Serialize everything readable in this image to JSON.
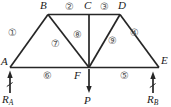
{
  "figure": {
    "nodes": {
      "A": "A",
      "B": "B",
      "C": "C",
      "D": "D",
      "E": "E",
      "F": "F"
    },
    "members": {
      "m1": "①",
      "m2": "②",
      "m3": "③",
      "m4": "④",
      "m5": "⑤",
      "m6": "⑥",
      "m7": "⑦",
      "m8": "⑧",
      "m9": "⑨"
    },
    "forces": {
      "reaction_left": {
        "symbol": "R",
        "subscript": "A"
      },
      "reaction_right": {
        "symbol": "R",
        "subscript": "B"
      },
      "load": "P"
    },
    "colors": {
      "line": "#262626",
      "node-label": "#1a1a1a",
      "member-label": "#555555",
      "bg": "#ffffff"
    }
  }
}
